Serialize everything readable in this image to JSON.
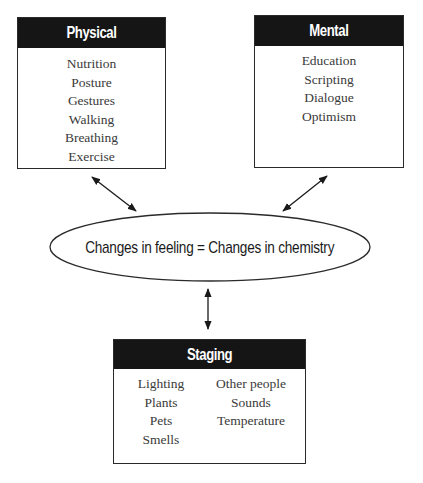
{
  "diagram": {
    "boxes": {
      "physical": {
        "title": "Physical",
        "items": [
          "Nutrition",
          "Posture",
          "Gestures",
          "Walking",
          "Breathing",
          "Exercise"
        ]
      },
      "mental": {
        "title": "Mental",
        "items": [
          "Education",
          "Scripting",
          "Dialogue",
          "Optimism"
        ]
      },
      "staging": {
        "title": "Staging",
        "left_items": [
          "Lighting",
          "Plants",
          "Pets",
          "Smells"
        ],
        "right_items": [
          "Other people",
          "Sounds",
          "Temperature"
        ]
      }
    },
    "center": {
      "text": "Changes in feeling = Changes in chemistry"
    },
    "connections": [
      {
        "from": "physical",
        "to": "center",
        "type": "bidirectional-arrow"
      },
      {
        "from": "mental",
        "to": "center",
        "type": "bidirectional-arrow"
      },
      {
        "from": "staging",
        "to": "center",
        "type": "bidirectional-arrow"
      }
    ],
    "colors": {
      "header_bg": "#151515",
      "header_text": "#ffffff",
      "border": "#2a2a2a",
      "item_text": "#3a3a3a"
    }
  }
}
